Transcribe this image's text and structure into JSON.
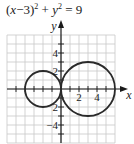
{
  "chart_data": {
    "type": "line",
    "title_parts": {
      "lhs_a": "(",
      "var_x": "x",
      "lhs_b": "−3)",
      "exp1": "2",
      "plus": " + ",
      "var_y": "y",
      "exp2": "2",
      "rhs": " = 9"
    },
    "xlabel": "x",
    "ylabel": "y",
    "xlim": [
      -6,
      6
    ],
    "ylim": [
      -6,
      6
    ],
    "grid": true,
    "grid_step": 1,
    "x_tick_labels": [
      "2",
      "4"
    ],
    "y_tick_labels": [
      "4",
      "2",
      "-2",
      "-4"
    ],
    "y_tick_labels_display": [
      "4",
      "2",
      "2",
      "−4"
    ],
    "series": [
      {
        "name": "circle (x−3)² + y² = 9",
        "shape": "circle",
        "center": [
          3,
          0
        ],
        "radius": 3
      },
      {
        "name": "circle (x+2)² + y² = 4",
        "shape": "circle",
        "center": [
          -2,
          0
        ],
        "radius": 2
      }
    ],
    "legend": "none"
  },
  "colors": {
    "curve": "#2a2a2a",
    "axis": "#1a1a1a",
    "grid": "#c8c8c8",
    "background": "#ffffff"
  }
}
